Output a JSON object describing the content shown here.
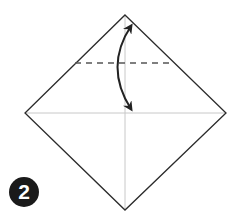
{
  "diagram": {
    "step_number": "2",
    "colors": {
      "outline": "#2b2b2b",
      "crease": "#c8c8c8",
      "dashed_fold": "#555555",
      "arrow": "#222222",
      "badge_bg": "#1a1a1a",
      "badge_text": "#ffffff"
    },
    "square": {
      "top": [
        125,
        15
      ],
      "right": [
        226,
        113
      ],
      "bottom": [
        125,
        210
      ],
      "left": [
        25,
        113
      ]
    },
    "creases": [
      {
        "name": "horizontal-crease",
        "from": [
          25,
          113
        ],
        "to": [
          226,
          113
        ]
      },
      {
        "name": "vertical-crease",
        "from": [
          125,
          15
        ],
        "to": [
          125,
          210
        ]
      }
    ],
    "valley_fold_line": {
      "from": [
        75,
        63
      ],
      "to": [
        174,
        63
      ],
      "style": "dashed"
    },
    "fold_arrow": {
      "type": "double-headed curved",
      "from": [
        130,
        24
      ],
      "to": [
        130,
        110
      ],
      "bulge_x": 112
    }
  }
}
